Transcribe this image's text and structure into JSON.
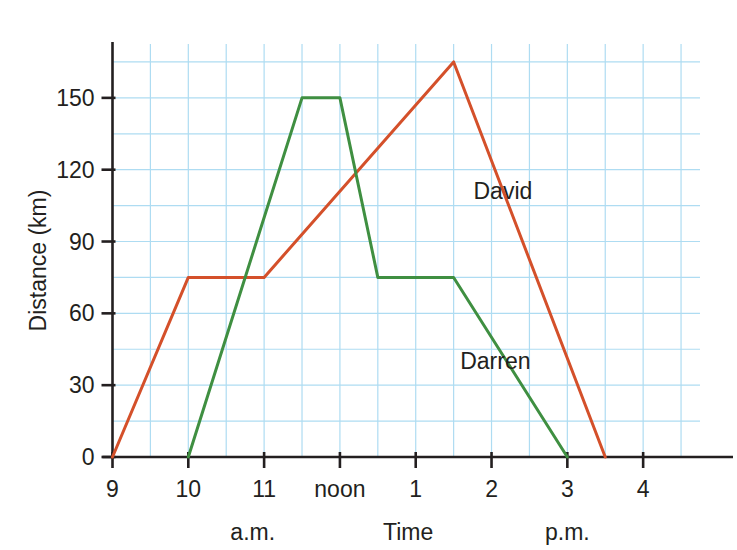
{
  "chart_data": {
    "type": "line",
    "title": "",
    "xlabel": "Time",
    "ylabel": "Distance (km)",
    "x_tick_labels": [
      "9",
      "10",
      "11",
      "noon",
      "1",
      "2",
      "3",
      "4"
    ],
    "x_tick_values": [
      9,
      10,
      11,
      12,
      13,
      14,
      15,
      16
    ],
    "y_tick_labels": [
      "0",
      "30",
      "60",
      "90",
      "120",
      "150"
    ],
    "y_tick_values": [
      0,
      30,
      60,
      90,
      120,
      150
    ],
    "xlim": [
      9,
      16.75
    ],
    "ylim": [
      0,
      172.5
    ],
    "grid": true,
    "grid_x_step_hours": 0.5,
    "grid_y_step_km": 15,
    "legend_position": "inline-annotation",
    "period_labels": [
      {
        "text": "a.m.",
        "at_hour": 10.85
      },
      {
        "text": "p.m.",
        "at_hour": 15.0
      }
    ],
    "series": [
      {
        "name": "David",
        "color": "#d4502a",
        "label_at": {
          "hour": 14.15,
          "km": 111
        },
        "points": [
          {
            "hour": 9,
            "time": "9 a.m.",
            "km": 0
          },
          {
            "hour": 10,
            "time": "10 a.m.",
            "km": 75
          },
          {
            "hour": 11,
            "time": "11 a.m.",
            "km": 75
          },
          {
            "hour": 13.5,
            "time": "1:30 p.m.",
            "km": 165
          },
          {
            "hour": 15.5,
            "time": "3:30 p.m.",
            "km": 0
          }
        ]
      },
      {
        "name": "Darren",
        "color": "#3f8f41",
        "label_at": {
          "hour": 14.05,
          "km": 40
        },
        "points": [
          {
            "hour": 10,
            "time": "10 a.m.",
            "km": 0
          },
          {
            "hour": 11.5,
            "time": "11:30 a.m.",
            "km": 150
          },
          {
            "hour": 12,
            "time": "noon",
            "km": 150
          },
          {
            "hour": 12.5,
            "time": "12:30 p.m.",
            "km": 75
          },
          {
            "hour": 13.5,
            "time": "1:30 p.m.",
            "km": 75
          },
          {
            "hour": 15,
            "time": "3 p.m.",
            "km": 0
          }
        ]
      }
    ],
    "colors": {
      "grid": "#aedcf2",
      "axis": "#231f20",
      "david": "#d4502a",
      "darren": "#3f8f41",
      "background": "#ffffff"
    }
  }
}
